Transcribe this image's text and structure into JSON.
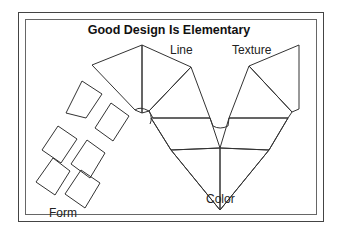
{
  "diagram": {
    "title": "Good Design Is Elementary",
    "labels": {
      "line": "Line",
      "texture": "Texture",
      "color": "Color",
      "form": "Form"
    },
    "colors": {
      "stroke": "#333333",
      "frame": "#444444",
      "background": "#ffffff"
    },
    "elements": [
      "Line",
      "Texture",
      "Color",
      "Form"
    ]
  }
}
